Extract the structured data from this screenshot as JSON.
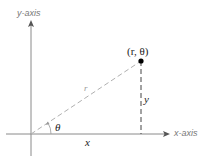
{
  "diagram": {
    "labels": {
      "y_axis_var": "y",
      "y_axis_suffix": "-axis",
      "x_axis_var": "x",
      "x_axis_suffix": "-axis",
      "point": "(r, θ)",
      "radius": "r",
      "angle": "θ",
      "horizontal_leg": "x",
      "vertical_leg": "y"
    },
    "colors": {
      "axis": "#8a8a8a",
      "dashed": "#b0b0b0",
      "point": "#000000",
      "text": "#222222"
    },
    "geometry": {
      "origin": [
        31,
        134
      ],
      "point": [
        141,
        61
      ]
    }
  }
}
